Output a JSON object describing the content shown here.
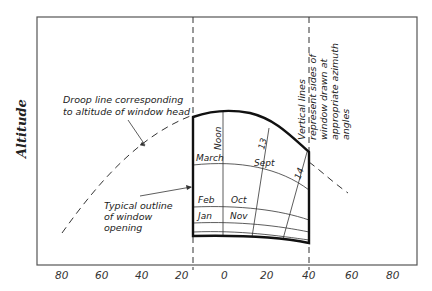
{
  "diagram": {
    "y_axis_label": "Altitude",
    "x_ticks": [
      "80",
      "60",
      "40",
      "20",
      "0",
      "20",
      "40",
      "60",
      "80"
    ],
    "annotations": {
      "droop_line_1": "Droop line corresponding",
      "droop_line_2": "to altitude of window head",
      "outline_1": "Typical outline",
      "outline_2": "of window",
      "outline_3": "opening",
      "vertical_1": "Vertical lines",
      "vertical_2": "represent sides of",
      "vertical_3": "window drawn at",
      "vertical_4": "appropriate azimuth",
      "vertical_5": "angles"
    },
    "sun_path_labels": {
      "noon": "Noon",
      "march": "March",
      "sept": "Sept",
      "hour_13": "13",
      "hour_14": "14",
      "feb": "Feb",
      "oct": "Oct",
      "jan": "Jan",
      "nov": "Nov"
    },
    "colors": {
      "line": "#222222",
      "frame": "#444444",
      "background": "#ffffff"
    }
  }
}
